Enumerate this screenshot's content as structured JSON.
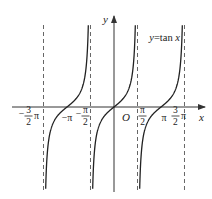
{
  "chart_data": {
    "type": "line",
    "title": "y=tan x",
    "function": "tan",
    "xlabel": "x",
    "ylabel": "y",
    "origin_label": "O",
    "curve_label": "y=tan x",
    "asymptotes": [
      {
        "x": -4.712,
        "label_num": "3",
        "label_den": "2",
        "label_sign": "−",
        "label_suffix": "π"
      },
      {
        "x": -1.571,
        "label_num": "π",
        "label_den": "2",
        "label_sign": "−",
        "label_suffix": ""
      },
      {
        "x": 1.571,
        "label_num": "π",
        "label_den": "2",
        "label_sign": "",
        "label_suffix": ""
      },
      {
        "x": 4.712,
        "label_num": "3",
        "label_den": "2",
        "label_sign": "",
        "label_suffix": "π"
      }
    ],
    "x_ticks": [
      {
        "value": -3.1416,
        "label": "−π"
      },
      {
        "value": 3.1416,
        "label": "π"
      }
    ],
    "branches": [
      {
        "center": -3.1416,
        "label": "branch around −π"
      },
      {
        "center": 0,
        "label": "branch around 0"
      },
      {
        "center": 3.1416,
        "label": "branch around π"
      }
    ],
    "xlim": [
      -5.2,
      5.8
    ],
    "grid": false,
    "legend": "none",
    "colors": {
      "curve": "#222222",
      "axis": "#333333",
      "asymptote": "#555555"
    }
  }
}
